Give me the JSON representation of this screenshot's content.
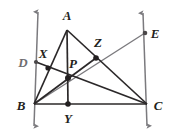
{
  "figure": {
    "kind": "geometry-diagram",
    "width": 170,
    "height": 133,
    "colors": {
      "ink": "#231f20",
      "cevian": "#2b2829",
      "ray": "#7b7a7e",
      "dot": "#231f20",
      "background": "#ffffff"
    },
    "labels": [
      {
        "id": "A",
        "text": "A",
        "x": 67,
        "y": 15,
        "muted": false
      },
      {
        "id": "E",
        "text": "E",
        "x": 155,
        "y": 33,
        "muted": false
      },
      {
        "id": "D",
        "text": "D",
        "x": 23,
        "y": 62,
        "muted": true
      },
      {
        "id": "X",
        "text": "X",
        "x": 43,
        "y": 53,
        "muted": false
      },
      {
        "id": "Z",
        "text": "Z",
        "x": 98,
        "y": 42,
        "muted": false
      },
      {
        "id": "P",
        "text": "P",
        "x": 73,
        "y": 63,
        "muted": false
      },
      {
        "id": "B",
        "text": "B",
        "x": 21,
        "y": 105,
        "muted": false
      },
      {
        "id": "C",
        "text": "C",
        "x": 158,
        "y": 105,
        "muted": false
      },
      {
        "id": "Y",
        "text": "Y",
        "x": 68,
        "y": 118,
        "muted": false
      }
    ],
    "points": [
      {
        "id": "A",
        "x": 67,
        "y": 30,
        "dot": false
      },
      {
        "id": "B",
        "x": 34,
        "y": 104,
        "dot": false
      },
      {
        "id": "C",
        "x": 147,
        "y": 104,
        "dot": false
      },
      {
        "id": "D",
        "x": 36,
        "y": 62,
        "dot": true
      },
      {
        "id": "E",
        "x": 145,
        "y": 33,
        "dot": true
      },
      {
        "id": "X",
        "x": 48,
        "y": 68,
        "dot": true
      },
      {
        "id": "Y",
        "x": 68,
        "y": 104,
        "dot": true
      },
      {
        "id": "Z",
        "x": 96,
        "y": 58,
        "dot": true
      },
      {
        "id": "P",
        "x": 68,
        "y": 78,
        "dot": true
      }
    ],
    "segments": [
      {
        "id": "AB",
        "from": "A",
        "to": "B",
        "style": "cevian"
      },
      {
        "id": "AC",
        "from": "A",
        "to": "C",
        "style": "cevian"
      },
      {
        "id": "BC",
        "from": "B",
        "to": "C",
        "style": "cevian"
      },
      {
        "id": "AY",
        "from": "A",
        "to": "Y",
        "style": "cevian"
      },
      {
        "id": "CX",
        "from": "C",
        "to": "D",
        "style": "cevian"
      },
      {
        "id": "BE",
        "from": "B",
        "to": "E",
        "style": "ray"
      },
      {
        "id": "BZ",
        "from": "B",
        "to": "Z",
        "style": "cevian"
      },
      {
        "id": "ZC",
        "from": "Z",
        "to": "C",
        "style": "cevian"
      }
    ],
    "rays": [
      {
        "id": "ray-D-through-B",
        "x1": 38,
        "y1": 12,
        "x2": 34,
        "y2": 126,
        "arrows": "both"
      },
      {
        "id": "ray-E-through-C",
        "x1": 143,
        "y1": 13,
        "x2": 147,
        "y2": 126,
        "arrows": "both"
      }
    ]
  }
}
